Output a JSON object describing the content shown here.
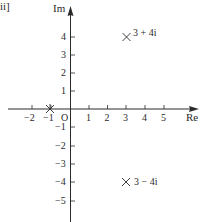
{
  "figure_label": "ii]",
  "axes": {
    "x_label": "Re",
    "y_label": "Im",
    "origin_label": "O",
    "x_ticks": [
      -2,
      -1,
      1,
      2,
      3,
      4,
      5
    ],
    "x_tick_labels": [
      "−2",
      "−1",
      "1",
      "2",
      "3",
      "4",
      "5"
    ],
    "y_ticks": [
      5,
      4,
      3,
      2,
      1,
      -1,
      -2,
      -3,
      -4,
      -5
    ],
    "y_tick_labels_pos": [
      "4",
      "3",
      "2",
      "1"
    ],
    "y_tick_labels_neg": [
      "−1",
      "−2",
      "−3",
      "−4",
      "−5"
    ],
    "x_range": [
      -3.5,
      6.8
    ],
    "y_range": [
      -6,
      5.6
    ]
  },
  "points": [
    {
      "re": 3,
      "im": 4,
      "label": "3 + 4i",
      "marker": "cross"
    },
    {
      "re": 3,
      "im": -4,
      "label": "3 − 4i",
      "marker": "cross"
    },
    {
      "re": -1,
      "im": 0,
      "label": "",
      "marker": "asterisk"
    }
  ],
  "colors": {
    "ink": "#2a2a2a",
    "background": "#ffffff"
  }
}
